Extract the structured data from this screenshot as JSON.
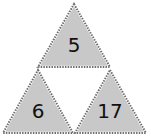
{
  "diagram": {
    "type": "triangle-puzzle",
    "fill_color": "#c8c8c8",
    "border_color": "#777777",
    "center_color": "#ffffff",
    "triangles": [
      {
        "position": "top",
        "value": "5"
      },
      {
        "position": "bottom-left",
        "value": "6"
      },
      {
        "position": "bottom-right",
        "value": "17"
      }
    ]
  }
}
